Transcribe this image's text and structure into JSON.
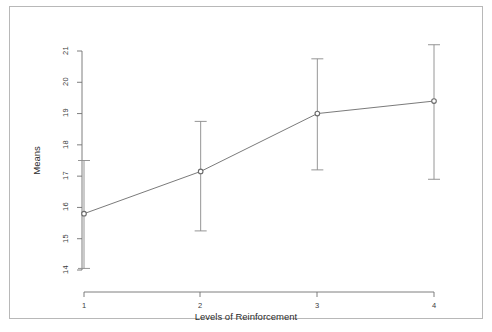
{
  "figure": {
    "border_color": "#b8b8b8",
    "background": "#ffffff",
    "line_color": "#5a5a5a",
    "axis_color": "#707070",
    "point_fill": "#8a8a8a"
  },
  "chart_data": {
    "type": "line",
    "title": "",
    "subtitle": "",
    "xlabel": "Levels of Reinforcement",
    "ylabel": "Means",
    "categories": [
      "1",
      "2",
      "3",
      "4"
    ],
    "x": [
      1,
      2,
      3,
      4
    ],
    "values": [
      15.8,
      17.15,
      19.0,
      19.4
    ],
    "error_low": [
      14.05,
      15.25,
      17.2,
      16.9
    ],
    "error_high": [
      17.5,
      18.75,
      20.75,
      21.2
    ],
    "series": [
      {
        "name": "Means",
        "values": [
          15.8,
          17.15,
          19.0,
          19.4
        ]
      }
    ],
    "xtick_labels": [
      "1",
      "2",
      "3",
      "4"
    ],
    "ytick_labels": [
      "14",
      "15",
      "16",
      "17",
      "18",
      "19",
      "20",
      "21"
    ],
    "ytick_values": [
      14,
      15,
      16,
      17,
      18,
      19,
      20,
      21
    ],
    "ylim": [
      14,
      21
    ],
    "xlim": [
      0.7,
      4.3
    ],
    "grid": false,
    "legend": false,
    "legend_position": "none",
    "marker": "circle-open",
    "error_bar_caps": true,
    "annotations": []
  }
}
